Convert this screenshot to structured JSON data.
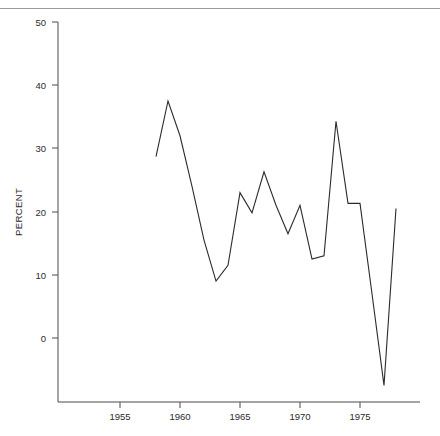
{
  "figure": {
    "background_color": "#ffffff",
    "line_color": "#2b2b2b",
    "axis_color": "#4a4a4a",
    "rule_color": "#9a9a9a"
  },
  "chart_data": {
    "type": "line",
    "title": "",
    "xlabel": "",
    "ylabel": "PERCENT",
    "xlim": [
      1950.5,
      1978.8
    ],
    "ylim": [
      -9,
      50
    ],
    "grid": false,
    "legend": null,
    "xticks": [
      1955,
      1960,
      1965,
      1970,
      1975
    ],
    "xtick_labels": [
      "1955",
      "1960",
      "1965",
      "1970",
      "1975"
    ],
    "yticks": [
      0,
      10,
      20,
      30,
      40,
      50
    ],
    "ytick_labels": [
      "0",
      "10",
      "20",
      "30",
      "40",
      "50"
    ],
    "series": [
      {
        "name": "percent",
        "x": [
          1958,
          1959,
          1960,
          1961,
          1962,
          1963,
          1964,
          1965,
          1966,
          1967,
          1968,
          1969,
          1970,
          1971,
          1972,
          1973,
          1974,
          1975,
          1976,
          1977,
          1978
        ],
        "values": [
          28.7,
          37.5,
          32.0,
          24.0,
          15.5,
          9.0,
          11.5,
          23.0,
          19.8,
          26.3,
          21.0,
          16.5,
          21.0,
          12.5,
          13.0,
          34.3,
          21.3,
          21.3,
          7.0,
          -7.5,
          20.5
        ]
      }
    ]
  }
}
